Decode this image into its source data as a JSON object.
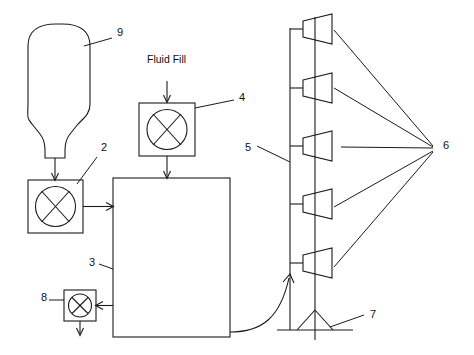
{
  "diagram": {
    "type": "patent-line-drawing",
    "background_color": "#ffffff",
    "line_color": "#1a1a1a",
    "canvas": {
      "width": 474,
      "height": 355
    }
  },
  "captions": {
    "fluid_fill": "Fluid Fill"
  },
  "reference_numerals": [
    {
      "id": "9",
      "label": "9",
      "refers_to": "flask-vessel",
      "x": 117,
      "y": 36
    },
    {
      "id": "4",
      "label": "4",
      "refers_to": "fluid-fill-valve",
      "x": 239,
      "y": 101
    },
    {
      "id": "2",
      "label": "2",
      "refers_to": "inlet-valve",
      "x": 101,
      "y": 151
    },
    {
      "id": "3",
      "label": "3",
      "refers_to": "main-unit",
      "x": 89,
      "y": 266
    },
    {
      "id": "8",
      "label": "8",
      "refers_to": "outlet-valve",
      "x": 41,
      "y": 301
    },
    {
      "id": "5",
      "label": "5",
      "refers_to": "riser-pole",
      "x": 245,
      "y": 151
    },
    {
      "id": "6",
      "label": "6",
      "refers_to": "nozzle-group",
      "x": 443,
      "y": 149
    },
    {
      "id": "7",
      "label": "7",
      "refers_to": "base-stand",
      "x": 370,
      "y": 318
    }
  ],
  "components": {
    "flask": {
      "name": "flask-vessel",
      "numeral": "9"
    },
    "inlet_valve": {
      "name": "inlet-valve",
      "numeral": "2",
      "symbol": "circle-with-cross"
    },
    "fill_valve": {
      "name": "fluid-fill-valve",
      "numeral": "4",
      "symbol": "circle-with-cross"
    },
    "outlet_valve": {
      "name": "outlet-valve",
      "numeral": "8",
      "symbol": "circle-with-cross"
    },
    "main_unit": {
      "name": "main-unit",
      "numeral": "3",
      "shape": "rectangle"
    },
    "pole": {
      "name": "riser-pole",
      "numeral": "5"
    },
    "nozzles": {
      "name": "nozzle-group",
      "numeral": "6",
      "count": 5,
      "shape": "trapezoid"
    },
    "stand": {
      "name": "base-stand",
      "numeral": "7",
      "shape": "triangle-on-ground-line"
    }
  }
}
